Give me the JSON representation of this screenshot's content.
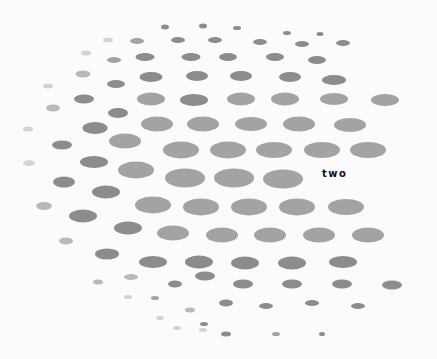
{
  "label": "two",
  "colors": {
    "background": "#fbfbfb",
    "dark": "#8c8c8c",
    "mid": "#a3a3a3",
    "light": "#b9b9b9",
    "faint": "#d4d4d4",
    "text": "#111111"
  },
  "dots": [
    [
      165,
      27,
      8,
      5,
      "dark"
    ],
    [
      203,
      26,
      8,
      5,
      "dark"
    ],
    [
      237,
      28,
      8,
      4,
      "dark"
    ],
    [
      287,
      33,
      8,
      4,
      "dark"
    ],
    [
      320,
      34,
      7,
      4,
      "dark"
    ],
    [
      108,
      40,
      10,
      5,
      "faint"
    ],
    [
      137,
      41,
      14,
      6,
      "mid"
    ],
    [
      178,
      40,
      14,
      6,
      "dark"
    ],
    [
      215,
      40,
      14,
      6,
      "dark"
    ],
    [
      260,
      42,
      14,
      6,
      "dark"
    ],
    [
      302,
      44,
      14,
      6,
      "dark"
    ],
    [
      343,
      43,
      14,
      6,
      "dark"
    ],
    [
      86,
      53,
      10,
      5,
      "faint"
    ],
    [
      114,
      60,
      14,
      6,
      "mid"
    ],
    [
      145,
      57,
      19,
      8,
      "dark"
    ],
    [
      191,
      57,
      19,
      8,
      "dark"
    ],
    [
      228,
      57,
      18,
      8,
      "dark"
    ],
    [
      275,
      57,
      18,
      8,
      "dark"
    ],
    [
      317,
      60,
      18,
      8,
      "dark"
    ],
    [
      83,
      74,
      15,
      7,
      "light"
    ],
    [
      116,
      84,
      18,
      8,
      "dark"
    ],
    [
      151,
      77,
      23,
      10,
      "dark"
    ],
    [
      197,
      76,
      22,
      10,
      "dark"
    ],
    [
      241,
      76,
      22,
      10,
      "dark"
    ],
    [
      290,
      77,
      22,
      10,
      "dark"
    ],
    [
      334,
      80,
      24,
      10,
      "dark"
    ],
    [
      48,
      86,
      10,
      5,
      "faint"
    ],
    [
      84,
      99,
      20,
      9,
      "dark"
    ],
    [
      151,
      99,
      28,
      13,
      "mid"
    ],
    [
      194,
      100,
      28,
      12,
      "dark"
    ],
    [
      241,
      99,
      28,
      13,
      "mid"
    ],
    [
      285,
      99,
      28,
      13,
      "mid"
    ],
    [
      334,
      99,
      28,
      12,
      "mid"
    ],
    [
      385,
      100,
      28,
      12,
      "mid"
    ],
    [
      53,
      108,
      14,
      7,
      "light"
    ],
    [
      118,
      113,
      20,
      10,
      "dark"
    ],
    [
      157,
      124,
      32,
      15,
      "mid"
    ],
    [
      203,
      124,
      32,
      15,
      "mid"
    ],
    [
      251,
      124,
      32,
      14,
      "mid"
    ],
    [
      299,
      124,
      32,
      15,
      "mid"
    ],
    [
      350,
      125,
      32,
      14,
      "mid"
    ],
    [
      28,
      129,
      10,
      5,
      "faint"
    ],
    [
      62,
      145,
      20,
      9,
      "dark"
    ],
    [
      95,
      128,
      25,
      12,
      "dark"
    ],
    [
      125,
      141,
      32,
      15,
      "mid"
    ],
    [
      181,
      150,
      36,
      17,
      "mid"
    ],
    [
      228,
      150,
      36,
      17,
      "mid"
    ],
    [
      274,
      150,
      36,
      16,
      "mid"
    ],
    [
      322,
      150,
      36,
      16,
      "mid"
    ],
    [
      368,
      150,
      36,
      16,
      "mid"
    ],
    [
      29,
      163,
      12,
      6,
      "faint"
    ],
    [
      94,
      162,
      28,
      12,
      "dark"
    ],
    [
      136,
      170,
      36,
      17,
      "mid"
    ],
    [
      185,
      178,
      40,
      19,
      "mid"
    ],
    [
      234,
      178,
      40,
      19,
      "mid"
    ],
    [
      283,
      179,
      40,
      19,
      "mid"
    ],
    [
      64,
      182,
      22,
      11,
      "dark"
    ],
    [
      106,
      192,
      28,
      13,
      "dark"
    ],
    [
      153,
      205,
      36,
      17,
      "mid"
    ],
    [
      201,
      207,
      36,
      17,
      "mid"
    ],
    [
      249,
      207,
      36,
      17,
      "mid"
    ],
    [
      297,
      207,
      36,
      17,
      "mid"
    ],
    [
      346,
      207,
      36,
      16,
      "mid"
    ],
    [
      44,
      206,
      16,
      8,
      "light"
    ],
    [
      83,
      216,
      28,
      13,
      "dark"
    ],
    [
      128,
      228,
      28,
      13,
      "dark"
    ],
    [
      173,
      233,
      32,
      15,
      "mid"
    ],
    [
      222,
      235,
      32,
      15,
      "mid"
    ],
    [
      270,
      235,
      32,
      15,
      "mid"
    ],
    [
      319,
      235,
      32,
      15,
      "mid"
    ],
    [
      368,
      235,
      32,
      15,
      "mid"
    ],
    [
      66,
      241,
      14,
      7,
      "light"
    ],
    [
      107,
      254,
      24,
      11,
      "dark"
    ],
    [
      153,
      262,
      28,
      12,
      "dark"
    ],
    [
      199,
      262,
      28,
      13,
      "dark"
    ],
    [
      245,
      263,
      28,
      13,
      "dark"
    ],
    [
      292,
      263,
      28,
      13,
      "dark"
    ],
    [
      343,
      262,
      28,
      12,
      "dark"
    ],
    [
      131,
      277,
      14,
      6,
      "light"
    ],
    [
      175,
      284,
      14,
      7,
      "dark"
    ],
    [
      205,
      276,
      20,
      9,
      "dark"
    ],
    [
      243,
      284,
      20,
      9,
      "dark"
    ],
    [
      292,
      284,
      20,
      9,
      "dark"
    ],
    [
      342,
      284,
      20,
      9,
      "dark"
    ],
    [
      392,
      285,
      20,
      9,
      "dark"
    ],
    [
      98,
      282,
      10,
      5,
      "light"
    ],
    [
      128,
      297,
      8,
      4,
      "faint"
    ],
    [
      155,
      298,
      8,
      4,
      "mid"
    ],
    [
      190,
      310,
      10,
      5,
      "light"
    ],
    [
      226,
      303,
      14,
      7,
      "dark"
    ],
    [
      266,
      306,
      14,
      6,
      "dark"
    ],
    [
      312,
      303,
      14,
      6,
      "dark"
    ],
    [
      358,
      306,
      14,
      6,
      "dark"
    ],
    [
      160,
      318,
      8,
      4,
      "faint"
    ],
    [
      177,
      328,
      8,
      4,
      "faint"
    ],
    [
      204,
      324,
      8,
      4,
      "dark"
    ],
    [
      226,
      334,
      10,
      5,
      "dark"
    ],
    [
      276,
      334,
      8,
      4,
      "mid"
    ],
    [
      322,
      334,
      6,
      4,
      "dark"
    ],
    [
      203,
      330,
      8,
      4,
      "faint"
    ]
  ]
}
